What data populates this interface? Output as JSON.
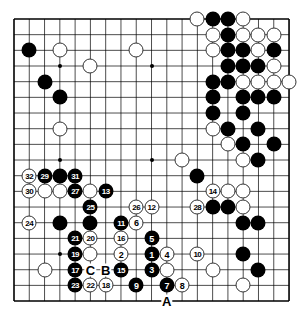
{
  "board": {
    "size": 19,
    "origin_x": 14,
    "origin_y": 19,
    "spacing_x": 15.28,
    "spacing_y": 15.67,
    "line_color": "#000000",
    "background": "#ffffff",
    "hoshi": [
      [
        3,
        3
      ],
      [
        9,
        3
      ],
      [
        15,
        3
      ],
      [
        3,
        9
      ],
      [
        9,
        9
      ],
      [
        15,
        9
      ],
      [
        3,
        15
      ],
      [
        9,
        15
      ],
      [
        15,
        15
      ]
    ]
  },
  "stones": {
    "black": [
      [
        1,
        2
      ],
      [
        2,
        4
      ],
      [
        3,
        5
      ],
      [
        13,
        0
      ],
      [
        14,
        0
      ],
      [
        14,
        1
      ],
      [
        14,
        2
      ],
      [
        15,
        2
      ],
      [
        17,
        2
      ],
      [
        14,
        3
      ],
      [
        15,
        3
      ],
      [
        16,
        3
      ],
      [
        13,
        4
      ],
      [
        14,
        4
      ],
      [
        13,
        5
      ],
      [
        15,
        5
      ],
      [
        16,
        5
      ],
      [
        17,
        5
      ],
      [
        13,
        6
      ],
      [
        15,
        6
      ],
      [
        14,
        7
      ],
      [
        16,
        7
      ],
      [
        15,
        8
      ],
      [
        17,
        8
      ],
      [
        16,
        9
      ],
      [
        12,
        10
      ],
      [
        13,
        12
      ],
      [
        14,
        12
      ],
      [
        15,
        13
      ],
      [
        16,
        13
      ],
      [
        15,
        15
      ],
      [
        16,
        16
      ],
      [
        3,
        10
      ],
      [
        3,
        13
      ],
      [
        5,
        13
      ]
    ],
    "white": [
      [
        3,
        2
      ],
      [
        8,
        2
      ],
      [
        5,
        3
      ],
      [
        3,
        7
      ],
      [
        12,
        0
      ],
      [
        15,
        0
      ],
      [
        13,
        1
      ],
      [
        15,
        1
      ],
      [
        16,
        1
      ],
      [
        17,
        1
      ],
      [
        13,
        2
      ],
      [
        16,
        2
      ],
      [
        17,
        3
      ],
      [
        15,
        4
      ],
      [
        16,
        4
      ],
      [
        17,
        4
      ],
      [
        18,
        4
      ],
      [
        13,
        7
      ],
      [
        14,
        8
      ],
      [
        11,
        9
      ],
      [
        15,
        9
      ],
      [
        14,
        11
      ],
      [
        15,
        11
      ],
      [
        15,
        12
      ],
      [
        2,
        11
      ],
      [
        3,
        11
      ],
      [
        5,
        11
      ],
      [
        5,
        15
      ],
      [
        2,
        16
      ],
      [
        10,
        16
      ],
      [
        13,
        16
      ],
      [
        15,
        17
      ]
    ]
  },
  "moves": [
    {
      "n": "1",
      "color": "black",
      "x": 9,
      "y": 15
    },
    {
      "n": "2",
      "color": "white",
      "x": 7,
      "y": 15
    },
    {
      "n": "3",
      "color": "black",
      "x": 9,
      "y": 16
    },
    {
      "n": "4",
      "color": "white",
      "x": 10,
      "y": 15
    },
    {
      "n": "5",
      "color": "black",
      "x": 9,
      "y": 14
    },
    {
      "n": "6",
      "color": "white",
      "x": 8,
      "y": 13
    },
    {
      "n": "7",
      "color": "black",
      "x": 10,
      "y": 17
    },
    {
      "n": "8",
      "color": "white",
      "x": 11,
      "y": 17
    },
    {
      "n": "9",
      "color": "black",
      "x": 8,
      "y": 17
    },
    {
      "n": "10",
      "color": "white",
      "x": 12,
      "y": 15
    },
    {
      "n": "11",
      "color": "black",
      "x": 7,
      "y": 13
    },
    {
      "n": "12",
      "color": "white",
      "x": 9,
      "y": 12
    },
    {
      "n": "13",
      "color": "black",
      "x": 6,
      "y": 11
    },
    {
      "n": "14",
      "color": "white",
      "x": 13,
      "y": 11
    },
    {
      "n": "15",
      "color": "black",
      "x": 7,
      "y": 16
    },
    {
      "n": "16",
      "color": "white",
      "x": 7,
      "y": 14
    },
    {
      "n": "17",
      "color": "black",
      "x": 4,
      "y": 16
    },
    {
      "n": "18",
      "color": "white",
      "x": 6,
      "y": 17
    },
    {
      "n": "19",
      "color": "black",
      "x": 4,
      "y": 15
    },
    {
      "n": "20",
      "color": "white",
      "x": 5,
      "y": 14
    },
    {
      "n": "21",
      "color": "black",
      "x": 4,
      "y": 14
    },
    {
      "n": "22",
      "color": "white",
      "x": 5,
      "y": 17
    },
    {
      "n": "23",
      "color": "black",
      "x": 4,
      "y": 17
    },
    {
      "n": "24",
      "color": "white",
      "x": 1,
      "y": 13
    },
    {
      "n": "25",
      "color": "black",
      "x": 5,
      "y": 12
    },
    {
      "n": "26",
      "color": "white",
      "x": 8,
      "y": 12
    },
    {
      "n": "27",
      "color": "black",
      "x": 4,
      "y": 11
    },
    {
      "n": "28",
      "color": "white",
      "x": 12,
      "y": 12
    },
    {
      "n": "29",
      "color": "black",
      "x": 2,
      "y": 10
    },
    {
      "n": "30",
      "color": "white",
      "x": 1,
      "y": 11
    },
    {
      "n": "31",
      "color": "black",
      "x": 4,
      "y": 10
    },
    {
      "n": "32",
      "color": "white",
      "x": 1,
      "y": 10
    }
  ],
  "labels": [
    {
      "text": "A",
      "x": 10,
      "y": 18
    },
    {
      "text": "B",
      "x": 6,
      "y": 16
    },
    {
      "text": "C",
      "x": 5,
      "y": 16
    }
  ]
}
